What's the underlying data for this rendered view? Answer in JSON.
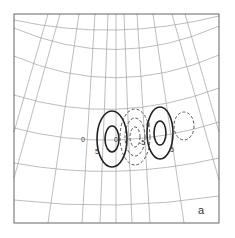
{
  "figure": {
    "panel_label": "a",
    "contour_labels": {
      "zero_left": "0",
      "pos_left": "5",
      "center_small": "0",
      "neg_center": "-5",
      "top_mid": "0",
      "pos_right": "5"
    },
    "legend": {
      "solid": "positive contours",
      "dashed": "negative contours"
    },
    "colors": {
      "grid": "#9a9a9a",
      "frame": "#555555",
      "contour": "#222222"
    }
  }
}
